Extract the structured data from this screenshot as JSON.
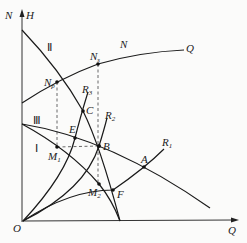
{
  "diagram": {
    "axes": {
      "vertical_label_left": "N",
      "vertical_label_right": "H",
      "horizontal_label": "Q",
      "origin_label": "O"
    },
    "curves": {
      "head_curve_II": "Ⅱ",
      "head_curve_III": "Ⅲ",
      "head_curve_I": "Ⅰ",
      "power_curve_label": "N",
      "power_curve_end_label": "Q"
    },
    "resistance_curves": [
      {
        "id": "R1",
        "label": "R",
        "sub": "1"
      },
      {
        "id": "R2",
        "label": "R",
        "sub": "2"
      },
      {
        "id": "R3",
        "label": "R",
        "sub": "3"
      }
    ],
    "points": [
      {
        "id": "Np",
        "label": "N",
        "sub": "p"
      },
      {
        "id": "Ns",
        "label": "N",
        "sub": "s"
      },
      {
        "id": "C",
        "label": "C"
      },
      {
        "id": "E",
        "label": "E"
      },
      {
        "id": "B",
        "label": "B"
      },
      {
        "id": "A",
        "label": "A"
      },
      {
        "id": "M1",
        "label": "M",
        "sub": "1"
      },
      {
        "id": "M2",
        "label": "M",
        "sub": "2"
      },
      {
        "id": "F",
        "label": "F"
      }
    ]
  }
}
